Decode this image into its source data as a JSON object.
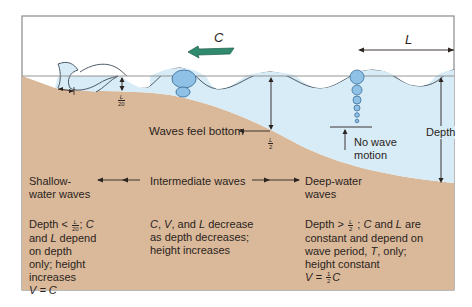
{
  "diagram": {
    "type": "ocean-wave-depth-zones",
    "colors": {
      "frame": "#8a8a8a",
      "seafloor": "#d9b99a",
      "water": "#d7ecf6",
      "orbit_fill": "#8fc1e6",
      "orbit_stroke": "#3b6f9b",
      "arrow_fill": "#2f8a6e",
      "line": "#2b2320",
      "text": "#2b2320"
    },
    "labels": {
      "wave_speed": "C",
      "wavelength": "L",
      "depth": "Depth",
      "waves_feel_bottom": "Waves feel bottom",
      "no_wave_motion_1": "No wave",
      "no_wave_motion_2": "motion",
      "l_over_20": {
        "num": "L",
        "den": "20"
      },
      "l_over_2": {
        "num": "L",
        "den": "2"
      }
    },
    "zones": [
      {
        "title_1": "Shallow-",
        "title_2": "water waves",
        "desc_prefix": "Depth < ",
        "desc_frac": {
          "num": "L",
          "den": "20"
        },
        "desc_after_frac": "; ",
        "desc_var1": "C",
        "desc_line2_a": "and ",
        "desc_line2_var": "L",
        "desc_line2_b": " depend",
        "desc_line3": "on depth",
        "desc_line4": "only; height",
        "desc_line5": "increases",
        "formula": "V = C"
      },
      {
        "title_1": "Intermediate waves",
        "desc_line1_a": "C",
        "desc_line1_b": ", ",
        "desc_line1_c": "V",
        "desc_line1_d": ", and ",
        "desc_line1_e": "L",
        "desc_line1_f": " decrease",
        "desc_line2": "as depth decreases;",
        "desc_line3": "height increases"
      },
      {
        "title_1": "Deep-water",
        "title_2": "waves",
        "desc_prefix": "Depth > ",
        "desc_frac": {
          "num": "L",
          "den": "2"
        },
        "desc_after_frac": " ; ",
        "desc_var1": "C",
        "desc_mid": " and ",
        "desc_var2": "L",
        "desc_end": " are",
        "desc_line2": "constant and depend on",
        "desc_line3_a": "wave period, ",
        "desc_line3_var": "T",
        "desc_line3_b": ", only;",
        "desc_line4": "height constant",
        "formula_prefix": "V = ",
        "formula_frac": {
          "num": "1",
          "den": "2"
        },
        "formula_suffix": "C"
      }
    ]
  }
}
